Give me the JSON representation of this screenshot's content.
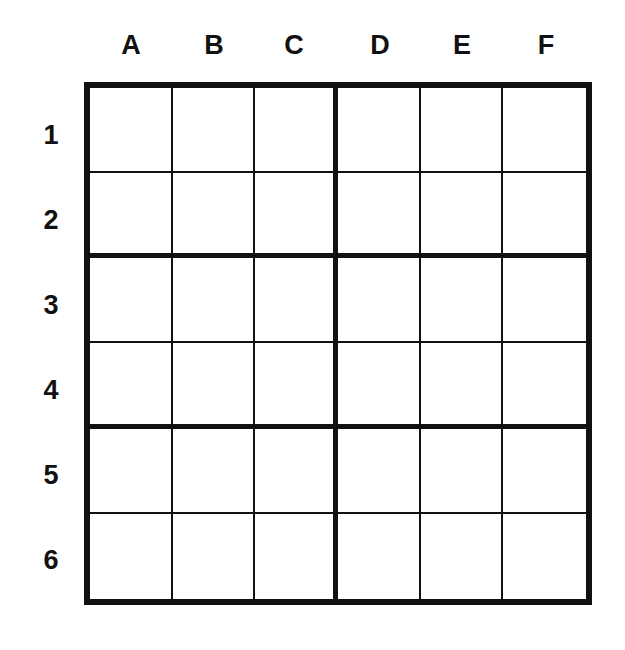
{
  "puzzle": {
    "columns": [
      "A",
      "B",
      "C",
      "D",
      "E",
      "F"
    ],
    "rows": [
      "1",
      "2",
      "3",
      "4",
      "5",
      "6"
    ],
    "cells": [
      [
        "",
        "",
        "",
        "",
        "",
        ""
      ],
      [
        "",
        "",
        "",
        "",
        "",
        ""
      ],
      [
        "",
        "",
        "",
        "",
        "",
        ""
      ],
      [
        "",
        "",
        "",
        "",
        "",
        ""
      ],
      [
        "",
        "",
        "",
        "",
        "",
        ""
      ],
      [
        "",
        "",
        "",
        "",
        "",
        ""
      ]
    ],
    "box_size": {
      "rows": 2,
      "cols": 3
    }
  }
}
